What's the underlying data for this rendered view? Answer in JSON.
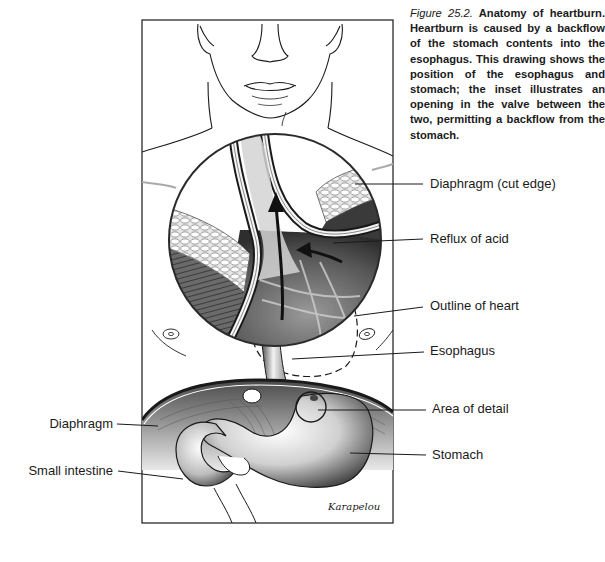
{
  "caption": {
    "figure_number": "Figure 25.2.",
    "text": "Anatomy of heartburn. Heartburn is caused by a backflow of the stomach contents into the esophagus. This drawing shows the position of the esophagus and stomach; the inset illustrates an opening in the valve between the two, permitting a backflow from the stomach."
  },
  "labels": {
    "right": [
      {
        "text": "Diaphragm (cut edge)"
      },
      {
        "text": "Reflux of acid"
      },
      {
        "text": "Outline of heart"
      },
      {
        "text": "Esophagus"
      },
      {
        "text": "Area of detail"
      },
      {
        "text": "Stomach"
      }
    ],
    "left": [
      {
        "text": "Diaphragm"
      },
      {
        "text": "Small intestine"
      }
    ]
  },
  "signature": "Karapelou",
  "colors": {
    "ink": "#1a1a1a",
    "background": "#ffffff",
    "shade_dark": "#3a3a3a",
    "shade_mid": "#8a8a8a",
    "shade_light": "#d8d8d8"
  }
}
